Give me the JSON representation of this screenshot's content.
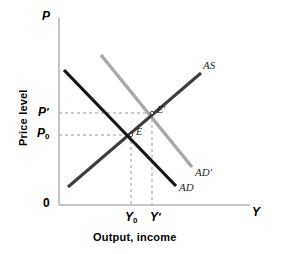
{
  "figure": {
    "type": "ad-as-diagram",
    "background": "#ffffff"
  },
  "axes": {
    "y_axis_symbol": "P",
    "x_axis_symbol": "Y",
    "origin_label": "0",
    "y_axis_title": "Price level",
    "x_axis_title": "Output, income",
    "axis_color": "#b5b5b5",
    "y_ticks": [
      {
        "label_main": "P",
        "label_sub": "′",
        "value": "P'",
        "y_px": 113
      },
      {
        "label_main": "P",
        "label_sub": "0",
        "value": "P0",
        "y_px": 135
      }
    ],
    "x_ticks": [
      {
        "label_main": "Y",
        "label_sub": "0",
        "value": "Y0",
        "x_px": 131
      },
      {
        "label_main": "Y",
        "label_sub": "′",
        "value": "Y'",
        "x_px": 152
      }
    ]
  },
  "curves": [
    {
      "name": "AD",
      "label": "AD",
      "kind": "aggregate-demand",
      "color": "#141414",
      "width": 3.2,
      "x1": 64,
      "y1": 70,
      "x2": 176,
      "y2": 186,
      "label_x": 179,
      "label_y": 188
    },
    {
      "name": "AD-prime",
      "label": "AD′",
      "kind": "aggregate-demand-shifted",
      "color": "#a8a8a8",
      "width": 3.4,
      "x1": 101,
      "y1": 55,
      "x2": 192,
      "y2": 167,
      "label_x": 195,
      "label_y": 173
    },
    {
      "name": "AS",
      "label": "AS",
      "kind": "aggregate-supply",
      "color": "#3d3d3d",
      "width": 3.0,
      "x1": 68,
      "y1": 187,
      "x2": 201,
      "y2": 73,
      "label_x": 203,
      "label_y": 66
    }
  ],
  "equilibria": [
    {
      "name": "E",
      "label": "E",
      "x": 131,
      "y": 135,
      "label_x": 136,
      "label_y": 133
    },
    {
      "name": "E-prime",
      "label": "E′",
      "x": 152,
      "y": 113,
      "label_x": 157,
      "label_y": 111
    }
  ],
  "guides": {
    "color": "#9a9a9a",
    "dash": "3,3",
    "horizontal": [
      {
        "name": "p0-guide",
        "y": 135,
        "x1": 59,
        "x2": 131
      },
      {
        "name": "pprime-guide",
        "y": 113,
        "x1": 59,
        "x2": 152
      }
    ],
    "vertical": [
      {
        "name": "y0-guide",
        "x": 131,
        "y1": 135,
        "y2": 205
      },
      {
        "name": "yprime-guide",
        "x": 152,
        "y1": 113,
        "y2": 205
      }
    ]
  },
  "geometry": {
    "plot_left": 59,
    "plot_right": 250,
    "plot_top": 18,
    "plot_bottom": 205
  }
}
